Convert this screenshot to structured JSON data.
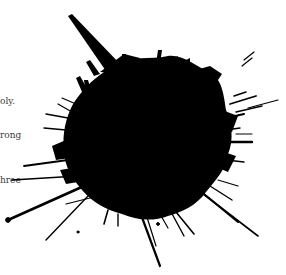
{
  "scene": {
    "description": "Black ink splatter over partially obscured serif text",
    "background_color": "#ffffff",
    "ink_color": "#000000",
    "text_color": "#3a3a3a"
  },
  "text_fragments": [
    {
      "text": "oly.",
      "x": 0,
      "y": 97
    },
    {
      "text": "rong",
      "x": 0,
      "y": 131
    },
    {
      "text": "hree",
      "x": 0,
      "y": 176
    }
  ]
}
